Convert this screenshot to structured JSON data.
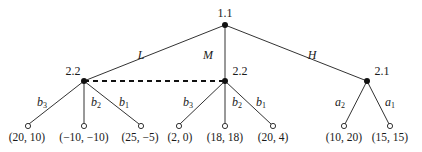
{
  "diagram": {
    "type": "extensive-form game tree",
    "colors": {
      "line": "#333333",
      "node": "#111111",
      "leaf_fill": "#ffffff"
    },
    "nodes": [
      {
        "id": "root",
        "label": "1.1",
        "x": 225,
        "y": 25
      },
      {
        "id": "left",
        "label": "2.2",
        "x": 84,
        "y": 81
      },
      {
        "id": "middle",
        "label": "2.2",
        "x": 225,
        "y": 81
      },
      {
        "id": "right",
        "label": "2.1",
        "x": 367,
        "y": 81
      }
    ],
    "edges": [
      {
        "from": "root",
        "to": "left",
        "label": "L"
      },
      {
        "from": "root",
        "to": "middle",
        "label": "M"
      },
      {
        "from": "root",
        "to": "right",
        "label": "H"
      }
    ],
    "information_set": {
      "connects": [
        "left",
        "middle"
      ],
      "style": "dashed"
    },
    "branches": [
      {
        "parent": "left",
        "label": "b",
        "sub": "3",
        "payoff": "(20, 10)"
      },
      {
        "parent": "left",
        "label": "b",
        "sub": "2",
        "payoff": "(−10, −10)"
      },
      {
        "parent": "left",
        "label": "b",
        "sub": "1",
        "payoff": "(25, −5)"
      },
      {
        "parent": "middle",
        "label": "b",
        "sub": "3",
        "payoff": "(2, 0)"
      },
      {
        "parent": "middle",
        "label": "b",
        "sub": "2",
        "payoff": "(18, 18)"
      },
      {
        "parent": "middle",
        "label": "b",
        "sub": "1",
        "payoff": "(20, 4)"
      },
      {
        "parent": "right",
        "label": "a",
        "sub": "2",
        "payoff": "(10, 20)"
      },
      {
        "parent": "right",
        "label": "a",
        "sub": "1",
        "payoff": "(15, 15)"
      }
    ]
  }
}
